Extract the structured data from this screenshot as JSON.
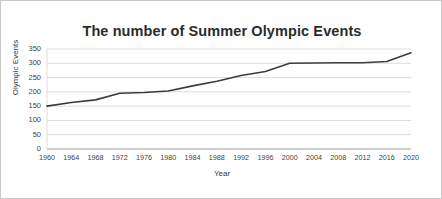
{
  "chart_data": {
    "type": "line",
    "title": "The number of Summer Olympic Events",
    "xlabel": "Year",
    "ylabel": "Olympic Events",
    "x": [
      1960,
      1964,
      1968,
      1972,
      1976,
      1980,
      1984,
      1988,
      1992,
      1996,
      2000,
      2004,
      2008,
      2012,
      2016,
      2020
    ],
    "categories": [
      "1960",
      "1964",
      "1968",
      "1972",
      "1976",
      "1980",
      "1984",
      "1988",
      "1992",
      "1996",
      "2000",
      "2004",
      "2008",
      "2012",
      "2016",
      "2020"
    ],
    "values": [
      150,
      163,
      172,
      195,
      198,
      203,
      221,
      237,
      257,
      271,
      300,
      301,
      302,
      302,
      306,
      337
    ],
    "series": [
      {
        "name": "Olympic Events",
        "values": [
          150,
          163,
          172,
          195,
          198,
          203,
          221,
          237,
          257,
          271,
          300,
          301,
          302,
          302,
          306,
          337
        ]
      }
    ],
    "ylim": [
      0,
      350
    ],
    "yticks": [
      0,
      50,
      100,
      150,
      200,
      250,
      300,
      350
    ],
    "ytick_labels": [
      "0",
      "50",
      "100",
      "150",
      "200",
      "250",
      "300",
      "350"
    ],
    "xlim": [
      1960,
      2020
    ],
    "grid": true,
    "grid_axis": "y",
    "legend": false,
    "legend_position": "none",
    "line_color": "#3c3c3c",
    "grid_color": "#d9d9d9",
    "axis_color": "#9a9a9a",
    "background_color": "#ffffff",
    "border_color": "#c8c8c8"
  }
}
